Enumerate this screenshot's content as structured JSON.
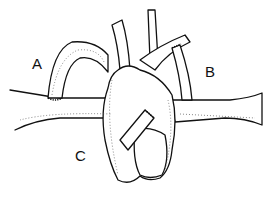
{
  "figure": {
    "labels": [
      {
        "id": "A",
        "text": "A"
      },
      {
        "id": "B",
        "text": "B"
      },
      {
        "id": "C",
        "text": "C"
      }
    ]
  }
}
